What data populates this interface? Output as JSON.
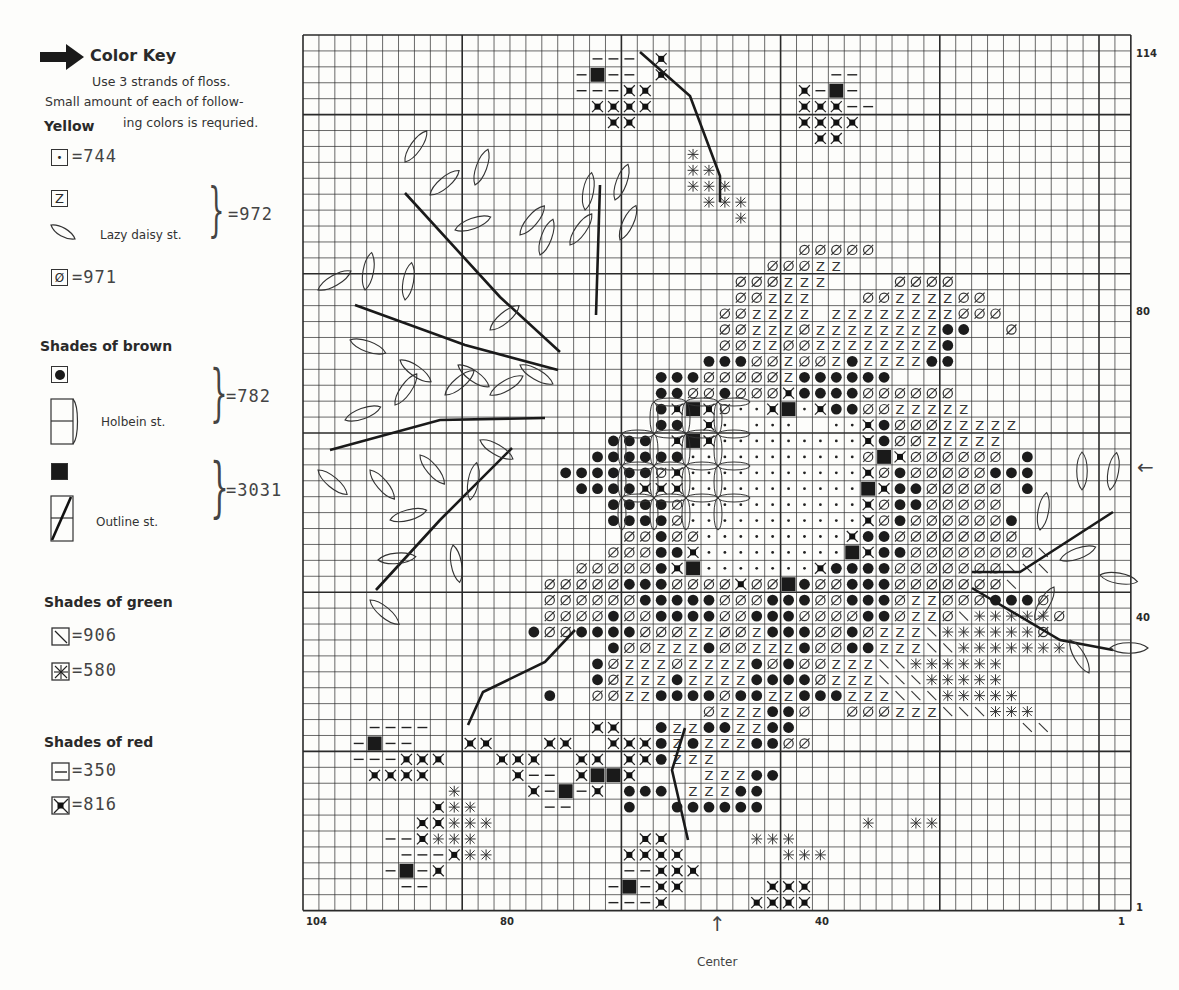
{
  "key": {
    "title": "Color Key",
    "instructions_line1": "Use 3 strands of floss.",
    "instructions_line2": "Small amount of each of follow-",
    "instructions_line3": "ing colors is requried.",
    "groups": [
      {
        "heading": "Yellow",
        "items": [
          {
            "symbol": "dot",
            "glyph": "•",
            "code": "=744"
          },
          {
            "symbol": "Z",
            "glyph": "Z",
            "code": ""
          },
          {
            "symbol": "lazy-daisy-leaf",
            "note": "Lazy daisy st.",
            "code": "=972"
          },
          {
            "symbol": "slashed-zero",
            "glyph": "Ø",
            "code": "=971"
          }
        ]
      },
      {
        "heading": "Shades of brown",
        "items": [
          {
            "symbol": "filled-circle",
            "glyph": "●",
            "code": ""
          },
          {
            "symbol": "holbein-stitch",
            "note": "Holbein st.",
            "code": "=782"
          },
          {
            "symbol": "filled-square",
            "glyph": "■",
            "code": ""
          },
          {
            "symbol": "outline-stitch",
            "note": "Outline st.",
            "code": "=3031"
          }
        ]
      },
      {
        "heading": "Shades of green",
        "items": [
          {
            "symbol": "backslash",
            "glyph": "\\",
            "code": "=906"
          },
          {
            "symbol": "star-cross",
            "glyph": "✱",
            "code": "=580"
          }
        ]
      },
      {
        "heading": "Shades of red",
        "items": [
          {
            "symbol": "dash",
            "glyph": "—",
            "code": "=350"
          },
          {
            "symbol": "cross-dot",
            "glyph": "⊠",
            "code": "=816"
          }
        ]
      }
    ]
  },
  "axes": {
    "bottom_labels": [
      {
        "text": "104",
        "x": 306
      },
      {
        "text": "80",
        "x": 500
      },
      {
        "text": "40",
        "x": 815
      },
      {
        "text": "1",
        "x": 1118
      }
    ],
    "right_labels": [
      {
        "text": "114",
        "y": 48
      },
      {
        "text": "80",
        "y": 306
      },
      {
        "text": "40",
        "y": 612
      },
      {
        "text": "1",
        "y": 902
      }
    ],
    "center_label": "Center",
    "center_arrow_bottom": "↑",
    "center_arrow_right": "←"
  },
  "chart_data": {
    "type": "cross-stitch-chart",
    "title": "Color Key",
    "grid": {
      "stitch_columns": 104,
      "stitch_rows": 114,
      "cells_drawn_cols": 52,
      "cells_drawn_rows": 55,
      "major_line_every": 10
    },
    "x_ticks": [
      "104",
      "80",
      "40",
      "1"
    ],
    "y_ticks": [
      "114",
      "80",
      "40",
      "1"
    ],
    "legend": [
      {
        "symbol": "•",
        "color_family": "Yellow",
        "dmc": "744"
      },
      {
        "symbol": "Z",
        "color_family": "Yellow",
        "dmc": "972"
      },
      {
        "symbol": "Lazy daisy st.",
        "color_family": "Yellow",
        "dmc": "972"
      },
      {
        "symbol": "Ø",
        "color_family": "Yellow",
        "dmc": "971"
      },
      {
        "symbol": "●",
        "color_family": "Brown",
        "dmc": "782"
      },
      {
        "symbol": "Holbein st.",
        "color_family": "Brown",
        "dmc": "782"
      },
      {
        "symbol": "■",
        "color_family": "Brown",
        "dmc": "3031"
      },
      {
        "symbol": "Outline st.",
        "color_family": "Brown",
        "dmc": "3031"
      },
      {
        "symbol": "\\",
        "color_family": "Green",
        "dmc": "906"
      },
      {
        "symbol": "✱",
        "color_family": "Green",
        "dmc": "580"
      },
      {
        "symbol": "—",
        "color_family": "Red",
        "dmc": "350"
      },
      {
        "symbol": "⊠",
        "color_family": "Red",
        "dmc": "816"
      }
    ],
    "symbol_codes": {
      ".": "empty",
      "d": "dot-744",
      "Z": "Z-972",
      "o": "slashed-zero-971",
      "c": "circle-782",
      "s": "square-3031",
      "b": "backslash-906",
      "x": "star-580",
      "-": "dash-350",
      "k": "cross-dot-816"
    },
    "rows_origin": {
      "col0": 0,
      "row0": 0
    },
    "rows": [
      "................................................",
      "..................---.k.........................",
      ".................-s--.k..........--.............",
      ".................---kk.........k-s-.............",
      "..................kkkk.........kkk--............",
      "...................kk..........kkkk.............",
      "................................kk..............",
      "........................x.......................",
      "........................xx......................",
      "........................xxx.....................",
      ".........................xxx....................",
      "...........................x....................",
      "...........................................................",
      "...............................ooooo............",
      ".............................oooZZ..............",
      "...........................oooZZZ....oooo.......",
      "...........................ooZZZ...ooZZZZoo.....",
      "..........................ooZZZZ.ZZZZZZZZooo....",
      "..........................ooZZZoZZZZZZZZcc..o...",
      "..........................ooZZooZZZZZZZZc.......",
      ".........................cccooZooZcZZZZcc.......",
      "......................cccoooooZcccccc...........",
      "......................ccoocoookccccoooooo.......",
      "......................ckskoddksdkccooZZZZZ......",
      "......................cc.kd.ddd..ddkcoooZZZZZ...",
      "...................ccc.kskdddddddddkcooZZZZZ....",
      "..................ccccccdddddddddddoskoooooo.c..",
      "................ccccccokdddddddddddkocoooooccc..",
      ".................cccckkkdddddddddddskccooooo.c..",
      "...................ccccodddddddddddkoccooooo....",
      "...................ccccodddddddddddkocooooooc...",
      "....................oocoodddddddddkccoooooooo...",
      "...................ooocckdddddddddskccoooooooob.",
      ".................ooooocksdddddddkccccooooooobbb.",
      "...............ooooocccooookooscoocccooooooob...",
      "...............oooooocccccooocccoocccoZZoooccco.",
      "...............oooocooccccoocccooooccoZZobxxxxxo",
      "..............cooccccoooZZooZcccoocoZZZbxxxxxxo.",
      "...................cooZZZcooZZZcooccZZZbbxxxxxxx",
      "..................coZZZoZZZZcocooZZZbbxxxxxx....",
      "..................coZZZcZZZZccccoZZZbbbxxxxx....",
      "...............c..ooZZccccoccZZcccZZZbbbxxxxx...",
      ".........................oZZZcco..oooZZZbbbxxx..",
      "....----..........kk..cZZccZZcc..............bb.",
      "...-s--...kk...kk..kkkcZcZZZccoo................",
      "...---kkk...kkk..kk.kkcZZZ.....................",
      "....kkkk.....k--.kssk....ZZZcc..................",
      ".........x....k-s-k.ccc.ZZZcc..................",
      "........kxx....--...c..cccccc...................",
      ".......kkxxx.......................x..xx........",
      ".....--kxxx..........kk.....xxx..................",
      "......---kxx........kkkk......xxx................",
      ".....-s-k...........--kkk.......................",
      "......--...........-s-kk.....kkk................",
      "...................---k.....kkkk................"
    ]
  }
}
